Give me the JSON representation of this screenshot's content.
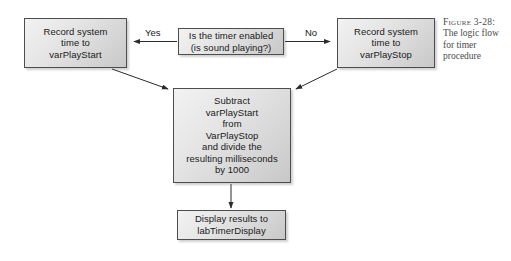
{
  "figure": {
    "caption_label": "Figure 3-28:",
    "caption_text": "The logic flow for timer procedure",
    "background_color": "#ffffff",
    "box_border_color": "#4d4d4d",
    "box_fill_top": "#f2f2f2",
    "box_fill_bottom": "#c8c8c8",
    "text_color": "#1a1a1a",
    "caption_color": "#4a4a4a"
  },
  "flowchart": {
    "type": "flowchart",
    "nodes": [
      {
        "id": "record-start",
        "label": "Record system\ntime to\nvarPlayStart",
        "shape": "rectangle"
      },
      {
        "id": "decision-timer-enabled",
        "label": "Is the timer enabled\n(is sound playing?)",
        "shape": "rectangle"
      },
      {
        "id": "record-stop",
        "label": "Record system\ntime to\nvarPlayStop",
        "shape": "rectangle"
      },
      {
        "id": "subtract",
        "label": "Subtract\nvarPlayStart\nfrom\nVarPlayStop\nand divide the\nresulting milliseconds\nby 1000",
        "shape": "rectangle"
      },
      {
        "id": "display",
        "label": "Display results to\nlabTimerDisplay",
        "shape": "rectangle"
      }
    ],
    "edges": [
      {
        "id": "yes",
        "from": "decision-timer-enabled",
        "to": "record-start",
        "label": "Yes"
      },
      {
        "id": "no",
        "from": "decision-timer-enabled",
        "to": "record-stop",
        "label": "No"
      },
      {
        "id": "start-to-subtract",
        "from": "record-start",
        "to": "subtract",
        "label": ""
      },
      {
        "id": "stop-to-subtract",
        "from": "record-stop",
        "to": "subtract",
        "label": ""
      },
      {
        "id": "subtract-to-display",
        "from": "subtract",
        "to": "display",
        "label": ""
      }
    ]
  }
}
